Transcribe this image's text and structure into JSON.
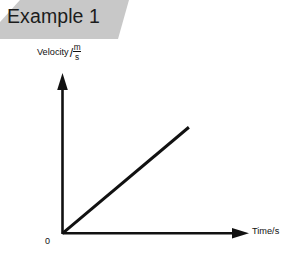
{
  "figure": {
    "title": "Example 1",
    "background_color": "#ffffff",
    "banner_color": "#c8c8c8",
    "ink_color": "#111111"
  },
  "axes": {
    "y_label_text": "Velocity",
    "y_label_separator": "/",
    "y_unit_numerator": "m",
    "y_unit_denominator": "s",
    "x_label": "Time/s",
    "origin_label": "0"
  },
  "chart_data": {
    "type": "line",
    "title": "Example 1",
    "xlabel": "Time/s",
    "ylabel": "Velocity/(m/s)",
    "grid": false,
    "legend": null,
    "axis_arrows": true,
    "tick_labels": {
      "x": [],
      "y": []
    },
    "origin_label": "0",
    "xlim": [
      0,
      10
    ],
    "ylim": [
      0,
      10
    ],
    "series": [
      {
        "name": "uniform acceleration",
        "x": [
          0,
          7.2
        ],
        "y": [
          0,
          7.2
        ],
        "style": "solid",
        "color": "#111111",
        "description": "straight line through the origin with constant positive gradient"
      }
    ]
  }
}
